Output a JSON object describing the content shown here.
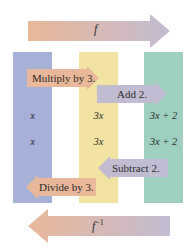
{
  "colors": {
    "column_domain": "#a7b0d6",
    "column_middle": "#f3e3a2",
    "column_range": "#9fcfbf",
    "arrow_orange": "#e9b89a",
    "arrow_lavender": "#c2bcd2"
  },
  "top_arrow": {
    "label": "f",
    "direction": "right"
  },
  "bottom_arrow": {
    "label": "f",
    "superscript": "−1",
    "direction": "left"
  },
  "forward_steps": [
    {
      "label": "Multiply by 3.",
      "direction": "right"
    },
    {
      "label": "Add 2.",
      "direction": "right"
    }
  ],
  "inverse_steps": [
    {
      "label": "Subtract 2.",
      "direction": "left"
    },
    {
      "label": "Divide by 3.",
      "direction": "left"
    }
  ],
  "rows": [
    {
      "domain": "x",
      "middle": "3x",
      "range": "3x + 2"
    },
    {
      "domain": "x",
      "middle": "3x",
      "range": "3x + 2"
    }
  ]
}
